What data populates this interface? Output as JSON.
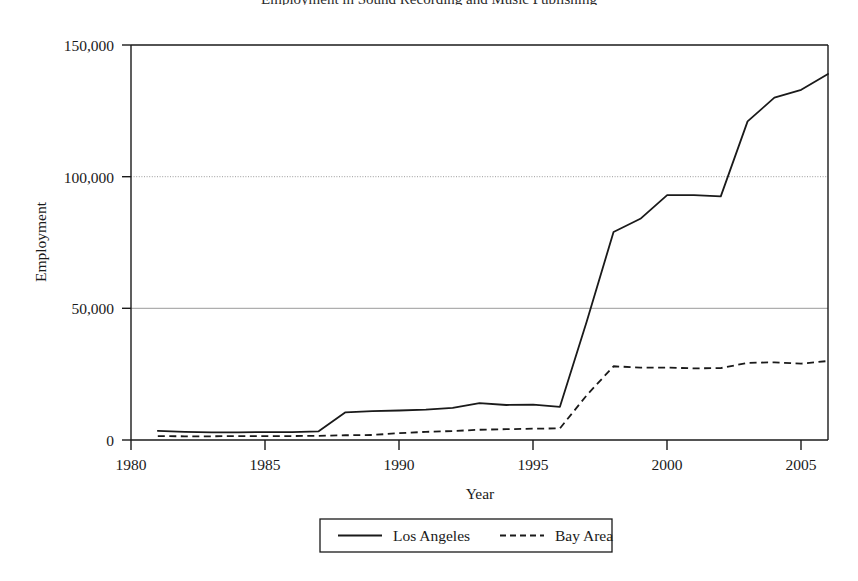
{
  "figure": {
    "cropped_top_caption": "Employment in Sound Recording and Music Publishing",
    "background_color": "#ffffff",
    "line_color": "#1a1a1a",
    "grid_color": "#9a9a9a",
    "frame_color": "#1a1a1a"
  },
  "chart_data": {
    "type": "line",
    "title": "",
    "xlabel": "Year",
    "ylabel": "Employment",
    "xlim": [
      1980,
      2006
    ],
    "ylim": [
      0,
      150000
    ],
    "grid": true,
    "grid_axis": "y",
    "legend_position": "bottom-center",
    "x_ticks": [
      1980,
      1985,
      1990,
      1995,
      2000,
      2005
    ],
    "x_tick_labels": [
      "1980",
      "1985",
      "1990",
      "1995",
      "2000",
      "2005"
    ],
    "y_ticks": [
      0,
      50000,
      100000,
      150000
    ],
    "y_tick_labels": [
      "0",
      "50,000",
      "100,000",
      "150,000"
    ],
    "x": [
      1981,
      1982,
      1983,
      1984,
      1985,
      1986,
      1987,
      1988,
      1989,
      1990,
      1991,
      1992,
      1993,
      1994,
      1995,
      1996,
      1997,
      1998,
      1999,
      2000,
      2001,
      2002,
      2003,
      2004,
      2005,
      2006
    ],
    "series": [
      {
        "name": "Los Angeles",
        "style": "solid",
        "values": [
          3500,
          3100,
          2900,
          2900,
          3000,
          3000,
          3300,
          10500,
          11000,
          11200,
          11500,
          12200,
          14000,
          13300,
          13400,
          12600,
          45000,
          79000,
          84000,
          93000,
          93000,
          92500,
          121000,
          130000,
          133000,
          139000
        ]
      },
      {
        "name": "Bay Area",
        "style": "dashed",
        "values": [
          1500,
          1400,
          1400,
          1500,
          1500,
          1500,
          1600,
          1800,
          1900,
          2600,
          3100,
          3400,
          3900,
          4100,
          4300,
          4400,
          17000,
          28000,
          27500,
          27500,
          27200,
          27300,
          29300,
          29500,
          29000,
          30000
        ]
      }
    ]
  },
  "legend": {
    "entries": [
      {
        "label": "Los Angeles",
        "style": "solid"
      },
      {
        "label": "Bay Area",
        "style": "dashed"
      }
    ]
  }
}
